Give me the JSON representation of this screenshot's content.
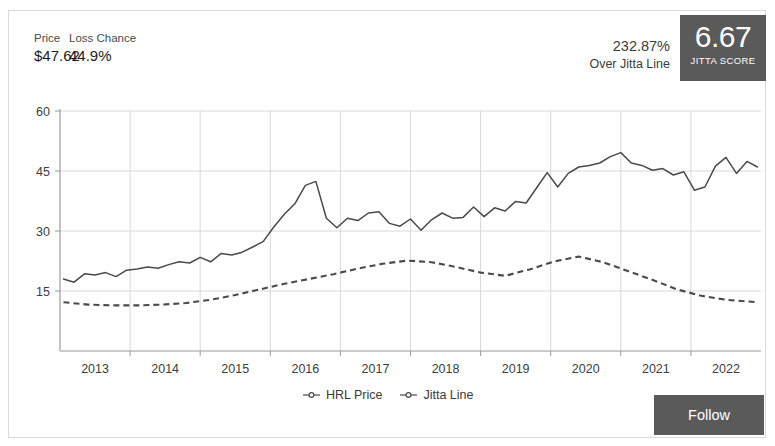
{
  "header": {
    "price_label": "Price",
    "price_value": "$47.62",
    "loss_label": "Loss Chance",
    "loss_value": "44.9%",
    "jitta_pct": "232.87%",
    "jitta_pct_sub": "Over Jitta Line",
    "score_value": "6.67",
    "score_caption": "JITTA SCORE"
  },
  "footer": {
    "follow_label": "Follow"
  },
  "colors": {
    "badge": "#5a5a5a",
    "line": "#4a4a4a",
    "grid": "#d8d8d8",
    "axis": "#9a9a9a",
    "text": "#333333"
  },
  "chart_data": {
    "type": "line",
    "title": "",
    "xlabel": "",
    "ylabel": "",
    "ylim": [
      0,
      60
    ],
    "yticks": [
      15,
      30,
      45,
      60
    ],
    "xlim": [
      2012.5,
      2022.5
    ],
    "categories": [
      "2013",
      "2014",
      "2015",
      "2016",
      "2017",
      "2018",
      "2019",
      "2020",
      "2021",
      "2022"
    ],
    "grid": true,
    "legend_position": "bottom",
    "series": [
      {
        "name": "HRL Price",
        "style": "solid",
        "x": [
          2012.55,
          2012.7,
          2012.85,
          2013.0,
          2013.15,
          2013.3,
          2013.45,
          2013.6,
          2013.75,
          2013.9,
          2014.05,
          2014.2,
          2014.35,
          2014.5,
          2014.65,
          2014.8,
          2014.95,
          2015.1,
          2015.25,
          2015.4,
          2015.55,
          2015.7,
          2015.85,
          2016.0,
          2016.15,
          2016.3,
          2016.45,
          2016.6,
          2016.75,
          2016.9,
          2017.05,
          2017.2,
          2017.35,
          2017.5,
          2017.65,
          2017.8,
          2017.95,
          2018.1,
          2018.25,
          2018.4,
          2018.55,
          2018.7,
          2018.85,
          2019.0,
          2019.15,
          2019.3,
          2019.45,
          2019.6,
          2019.75,
          2019.9,
          2020.05,
          2020.2,
          2020.35,
          2020.5,
          2020.65,
          2020.8,
          2020.95,
          2021.1,
          2021.25,
          2021.4,
          2021.55,
          2021.7,
          2021.85,
          2022.0,
          2022.15,
          2022.3,
          2022.45
        ],
        "y": [
          18.0,
          17.2,
          19.3,
          19.0,
          19.6,
          18.6,
          20.2,
          20.5,
          21.0,
          20.7,
          21.6,
          22.3,
          22.0,
          23.4,
          22.3,
          24.4,
          24.0,
          24.7,
          26.0,
          27.4,
          31.0,
          34.2,
          36.8,
          41.4,
          42.4,
          33.2,
          30.8,
          33.2,
          32.6,
          34.5,
          34.8,
          31.9,
          31.2,
          33.0,
          30.2,
          32.8,
          34.5,
          33.2,
          33.4,
          36.0,
          33.6,
          35.8,
          35.0,
          37.4,
          37.0,
          40.8,
          44.6,
          41.0,
          44.4,
          46.0,
          46.4,
          47.0,
          48.6,
          49.6,
          47.0,
          46.4,
          45.2,
          45.6,
          44.0,
          44.8,
          40.2,
          41.0,
          46.2,
          48.4,
          44.4,
          47.4,
          46.0
        ]
      },
      {
        "name": "Jitta Line",
        "style": "dashed",
        "x": [
          2012.55,
          2012.9,
          2013.25,
          2013.6,
          2013.95,
          2014.3,
          2014.65,
          2015.0,
          2015.35,
          2015.7,
          2016.05,
          2016.4,
          2016.75,
          2017.1,
          2017.45,
          2017.8,
          2018.15,
          2018.5,
          2018.85,
          2019.2,
          2019.55,
          2019.9,
          2020.25,
          2020.6,
          2020.95,
          2021.3,
          2021.65,
          2022.0,
          2022.45
        ],
        "y": [
          12.2,
          11.6,
          11.4,
          11.4,
          11.6,
          12.0,
          12.8,
          14.0,
          15.4,
          16.8,
          18.0,
          19.2,
          20.6,
          21.8,
          22.6,
          22.2,
          21.0,
          19.6,
          18.8,
          20.4,
          22.4,
          23.6,
          22.2,
          20.0,
          17.8,
          15.4,
          13.8,
          12.8,
          12.2
        ]
      }
    ]
  }
}
